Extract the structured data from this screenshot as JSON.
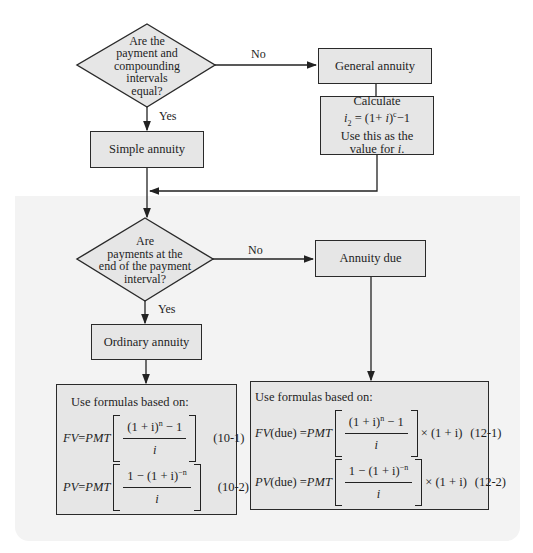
{
  "decision1": {
    "lines": [
      "Are the",
      "payment and",
      "compounding",
      "intervals",
      "equal?"
    ],
    "no_label": "No",
    "yes_label": "Yes"
  },
  "general_annuity": {
    "label": "General annuity"
  },
  "calculate_box": {
    "line1": "Calculate",
    "formula_lhs": "i",
    "formula_sub": "2",
    "formula_mid": " = (1+ ",
    "formula_i": "i",
    "formula_close": ")",
    "formula_exp": "c",
    "formula_tail": "−1",
    "line3": "Use this as the",
    "line4_prefix": "value for ",
    "line4_var": "i",
    "line4_suffix": "."
  },
  "simple_annuity": {
    "label": "Simple annuity"
  },
  "decision2": {
    "lines": [
      "Are",
      "payments at the",
      "end of the payment",
      "interval?"
    ],
    "no_label": "No",
    "yes_label": "Yes"
  },
  "annuity_due": {
    "label": "Annuity due"
  },
  "ordinary_annuity": {
    "label": "Ordinary annuity"
  },
  "ordinary_formulas": {
    "heading": "Use formulas based on:",
    "fv": {
      "lhs": "FV",
      "eq": " = ",
      "pmt": "PMT",
      "num": "(1 + i)",
      "num_exp": "n",
      "num_tail": " − 1",
      "den": "i",
      "ref": "(10-1)"
    },
    "pv": {
      "lhs": "PV",
      "eq": " = ",
      "pmt": "PMT",
      "num": "1 − (1 + i)",
      "num_exp": "−n",
      "den": "i",
      "ref": "(10-2)"
    }
  },
  "due_formulas": {
    "heading": "Use formulas based on:",
    "fv": {
      "lhs": "FV",
      "lhs_suffix": "(due) = ",
      "pmt": "PMT",
      "num": "(1 + i)",
      "num_exp": "n",
      "num_tail": " − 1",
      "den": "i",
      "mult": "× (1 + i)",
      "ref": "(12-1)"
    },
    "pv": {
      "lhs": "PV",
      "lhs_suffix": "(due) = ",
      "pmt": "PMT",
      "num": "1 − (1 + i)",
      "num_exp": "−n",
      "den": "i",
      "mult": "× (1 + i)",
      "ref": "(12-2)"
    }
  },
  "colors": {
    "box_fill": "#e6e6e6",
    "panel": "#f3f3f3",
    "stroke": "#2a2a2a"
  }
}
